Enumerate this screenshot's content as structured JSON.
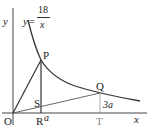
{
  "diagram": {
    "axes": {
      "x_label": "x",
      "y_label": "y",
      "origin_label": "O"
    },
    "curve": {
      "equation_lhs": "y=",
      "numerator": "18",
      "denominator": "x"
    },
    "points": {
      "P": "P",
      "Q": "Q",
      "R": "R",
      "S": "S",
      "T": "T"
    },
    "annotations": {
      "a": "a",
      "three_a": "3a"
    },
    "colors": {
      "line": "#333333",
      "background": "#ffffff"
    }
  }
}
